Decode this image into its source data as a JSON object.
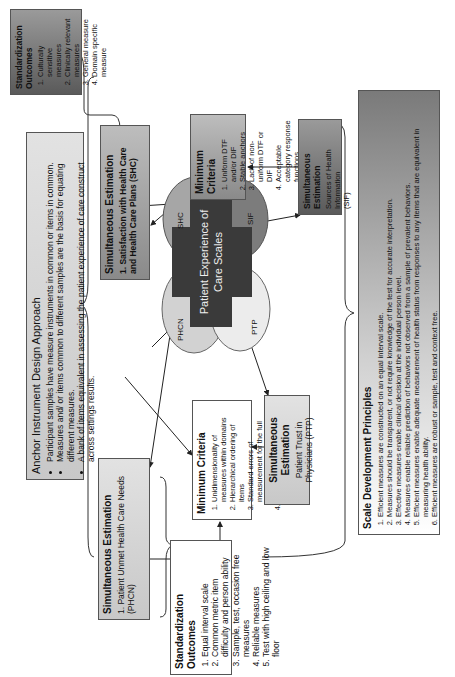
{
  "anchor": {
    "title": "Anchor Instrument Design Approach",
    "bullets": [
      "Participant samples have measure instruments in common or items in common.",
      "Measures and/ or items common to different samples are the basis for equating different measures.",
      "A bank of items equivalent in assessing the patient experience of care construct across settings results."
    ]
  },
  "se_shc": {
    "title": "Simultaneous Estimation",
    "item": "1. Satisfaction with Health Care and Health Care Plans (SHC)"
  },
  "se_phcn": {
    "title": "Simultaneous Estimation",
    "item": "1. Patient Unmet Health Care Needs (PHCN)"
  },
  "se_ptp": {
    "title": "Simultaneous Estimation",
    "line1": "Patient Trust in",
    "line2": "Physicians (PTP)"
  },
  "se_sif": {
    "title": "Simultaneous Estimation",
    "line1": "Sources of Health Information",
    "line2": "(SIF)"
  },
  "std_left": {
    "title": "Standardization Outcomes",
    "items": [
      "Equal interval scale",
      "Common metric item difficulty and person ability",
      "Sample, test, occasion free measures",
      "Reliable measures",
      "Test with high ceiling and low floor"
    ]
  },
  "std_right": {
    "title": "Standardization Outcomes",
    "items": [
      "Culturally sensitive measures",
      "Clinically relevant measures",
      "General measure",
      "Domain specific measure"
    ]
  },
  "min_left": {
    "title": "Minimum Criteria",
    "items": [
      "Unidimensionality of measures within domains",
      "Hierarchical ordering of items",
      "Standard errors of measurement for the full range of the test",
      "Acceptable fit statistics"
    ]
  },
  "min_right": {
    "title": "Minimum Criteria",
    "items": [
      "Uniform DTF and/or DIF",
      "Stable anchors",
      "Lack of non-uniform DTF or DIF",
      "Acceptable category response functions"
    ]
  },
  "core": {
    "label_line1": "Patient Experience of",
    "label_line2": "Care Scales",
    "lobes": {
      "shc": "SHC",
      "sif": "SIF",
      "phcn": "PHCN",
      "ptp": "PTP"
    }
  },
  "principles": {
    "title": "Scale Development Principles",
    "items": [
      "Efficient measures are constructed on an equal interval scale.",
      "Measures should be transparent, or not require knowledge of the test for accurate interpretation.",
      "Effective measures enable clinical decision at the individual person level.",
      "Measures enable reliable prediction of behaviors not observed from a sample of prevalent behaviors.",
      "Efficient measures enable adequate measurement of health status from responses to any items that are equivalent in measuring health ability.",
      "Efficient measures are robust or sample, test and context free."
    ]
  },
  "colors": {
    "light_box": "#d6d6d6",
    "mid_box": "#a8a8a8",
    "dark_box": "#7a7a7a",
    "core": "#3a3a3a",
    "lobe_light": "#c4c4c4",
    "lobe_mid": "#9a9a9a",
    "lobe_dark": "#6e6e6e"
  }
}
